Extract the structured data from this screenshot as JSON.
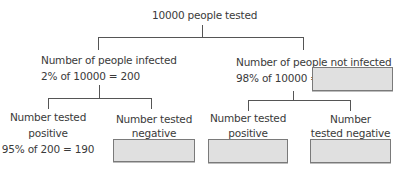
{
  "root": {
    "label": "10000 people tested"
  },
  "infected": {
    "label": "Number of people infected",
    "calculation": "2% of 10000 = 200"
  },
  "not_infected": {
    "label": "Number of people not infected",
    "calculation": "98% of 10000 =",
    "answer": ""
  },
  "infected_positive": {
    "label_line1": "Number tested",
    "label_line2": "positive",
    "calculation": "95% of 200 = 190"
  },
  "infected_negative": {
    "label_line1": "Number tested",
    "label_line2": "negative",
    "answer": ""
  },
  "not_infected_positive": {
    "label_line1": "Number tested",
    "label_line2": "positive",
    "answer": ""
  },
  "not_infected_negative": {
    "label_line1": "Number",
    "label_line2": "tested negative",
    "answer": ""
  },
  "colors": {
    "text": "#3a3a3a",
    "line": "#555555",
    "box_fill": "#e0e0e0",
    "box_border": "#7a7a7a"
  }
}
